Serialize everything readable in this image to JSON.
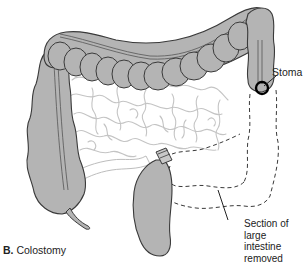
{
  "figure": {
    "caption_letter": "B.",
    "caption_text": "Colostomy"
  },
  "labels": {
    "stoma": "Stoma",
    "removed_section_line1": "Section of",
    "removed_section_line2": "large intestine",
    "removed_section_line3": "removed"
  },
  "anatomy": {
    "structures": [
      "transverse colon",
      "ascending colon",
      "cecum with appendix",
      "descending colon",
      "stoma",
      "small intestine",
      "rectum stump",
      "removed section (dashed outline)"
    ]
  },
  "colors": {
    "colon_fill": "#b4b4b4",
    "outline": "#3a3a3a",
    "small_intestine": "#c8c8c8",
    "stoma_ring": "#000000",
    "text": "#222222"
  }
}
